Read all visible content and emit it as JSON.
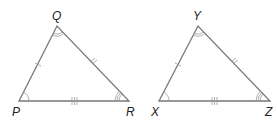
{
  "diagram": {
    "type": "congruent-triangles",
    "colors": {
      "side": "#777777",
      "mark": "#999999",
      "label": "#222222"
    },
    "triangles": [
      {
        "name": "PQR",
        "vertices": {
          "P": {
            "label": "P",
            "x": 19,
            "y": 101,
            "label_x": 13,
            "label_y": 115,
            "angle_arcs": 1
          },
          "Q": {
            "label": "Q",
            "x": 57,
            "y": 26,
            "label_x": 52,
            "label_y": 20,
            "angle_arcs": 2
          },
          "R": {
            "label": "R",
            "x": 129,
            "y": 101,
            "label_x": 127,
            "label_y": 115,
            "angle_arcs": 3
          }
        },
        "sides": [
          {
            "name": "PQ",
            "ticks": 1
          },
          {
            "name": "QR",
            "ticks": 2
          },
          {
            "name": "PR",
            "ticks": 3
          }
        ]
      },
      {
        "name": "XYZ",
        "vertices": {
          "X": {
            "label": "X",
            "x": 159,
            "y": 101,
            "label_x": 151,
            "label_y": 115,
            "angle_arcs": 1
          },
          "Y": {
            "label": "Y",
            "x": 198,
            "y": 26,
            "label_x": 193,
            "label_y": 20,
            "angle_arcs": 2
          },
          "Z": {
            "label": "Z",
            "x": 270,
            "y": 101,
            "label_x": 266,
            "label_y": 115,
            "angle_arcs": 3
          }
        },
        "sides": [
          {
            "name": "XY",
            "ticks": 1
          },
          {
            "name": "YZ",
            "ticks": 2
          },
          {
            "name": "XZ",
            "ticks": 3
          }
        ]
      }
    ]
  }
}
